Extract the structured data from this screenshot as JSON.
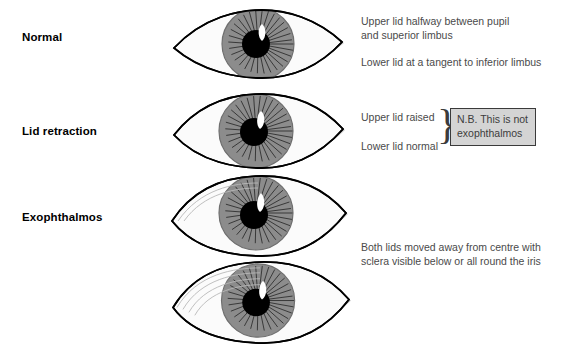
{
  "colors": {
    "ink": "#000000",
    "text_gray": "#4a4a4a",
    "iris_gray": "#8c8c8c",
    "iris_stripe": "#3a3a3a",
    "pupil": "#000000",
    "highlight": "#ffffff",
    "sclera": "#fbfbfb",
    "canthus_shade": "#c9c9c9",
    "note_fill": "#d4d4d4",
    "note_border": "#3a3a3a"
  },
  "rows": [
    {
      "label": "Normal",
      "label_x": 22,
      "label_y": 31,
      "eye": {
        "name": "eye-normal",
        "x": 170,
        "y": 8,
        "width": 175,
        "height": 70,
        "lid_open": 0.62,
        "upper_lid_covers_iris": true,
        "has_dashed_limbus_arc": true,
        "sclera_below_iris": false,
        "crease_lines": 0
      },
      "notes": [
        {
          "name": "note-normal-upper",
          "x": 361,
          "y": 14,
          "lines": [
            "Upper lid halfway between pupil",
            "and superior limbus"
          ]
        },
        {
          "name": "note-normal-lower",
          "x": 361,
          "y": 55,
          "lines": [
            "Lower lid at a tangent to inferior limbus"
          ]
        }
      ]
    },
    {
      "label": "Lid retraction",
      "label_x": 22,
      "label_y": 125,
      "eye": {
        "name": "eye-lid-retraction",
        "x": 170,
        "y": 95,
        "width": 175,
        "height": 72,
        "lid_open": 0.82,
        "upper_lid_covers_iris": false,
        "has_dashed_limbus_arc": false,
        "sclera_below_iris": false,
        "crease_lines": 0
      },
      "notes": [
        {
          "name": "note-retraction-upper",
          "x": 361,
          "y": 108,
          "lines": [
            "Upper lid raised"
          ]
        },
        {
          "name": "note-retraction-lower",
          "x": 361,
          "y": 137,
          "lines": [
            "Lower lid normal"
          ]
        }
      ],
      "nb_box": {
        "name": "nb-callout",
        "x": 450,
        "y": 108,
        "width": 86,
        "height": 36,
        "lines": [
          "N.B. This is not",
          "exophthalmos"
        ]
      },
      "brace": {
        "name": "brace-bracket",
        "x": 437,
        "y": 104,
        "glyph": "}"
      }
    },
    {
      "label": "Exophthalmos",
      "label_x": 22,
      "label_y": 211,
      "eye": {
        "name": "eye-exophthalmos",
        "x": 170,
        "y": 177,
        "width": 180,
        "height": 78,
        "lid_open": 0.88,
        "upper_lid_covers_iris": false,
        "has_dashed_limbus_arc": false,
        "sclera_below_iris": true,
        "crease_lines": 2
      },
      "notes": []
    },
    {
      "label": "",
      "eye": {
        "name": "eye-exophthalmos-severe",
        "x": 170,
        "y": 262,
        "width": 185,
        "height": 83,
        "lid_open": 0.95,
        "upper_lid_covers_iris": false,
        "has_dashed_limbus_arc": false,
        "sclera_below_iris": true,
        "sclera_all_round": true,
        "crease_lines": 4
      },
      "notes": [
        {
          "name": "note-exophthalmos",
          "x": 361,
          "y": 240,
          "lines": [
            "Both lids moved away from centre with",
            "sclera visible below or all round the iris"
          ]
        }
      ]
    }
  ]
}
